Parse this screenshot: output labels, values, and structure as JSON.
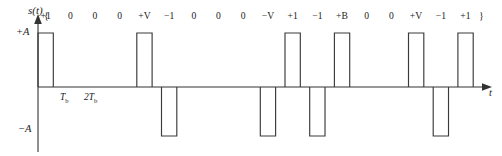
{
  "figure": {
    "signal_label": "s(t)",
    "amplitude_positive_label": "+A",
    "amplitude_negative_label": "−A",
    "time_axis_label": "t",
    "brace_open": "{",
    "brace_close": "}",
    "tick_labels": [
      {
        "text": "T",
        "sub": "b",
        "x": 60
      },
      {
        "text": "2T",
        "sub": "b",
        "x": 84
      }
    ]
  },
  "chart_data": {
    "type": "line",
    "title": "",
    "subtitle": "",
    "xlabel": "t",
    "ylabel": "s(t)",
    "grid": false,
    "legend": "none",
    "ylim": [
      -1,
      1
    ],
    "ytick_labels": [
      "+A",
      "−A"
    ],
    "ytick_values": [
      1,
      -1
    ],
    "xtick_labels": [
      "T_b",
      "2T_b"
    ],
    "xtick_values": [
      1,
      2
    ],
    "bit_period_px": 24.7,
    "origin_px": {
      "x": 38,
      "y": 87
    },
    "level_px": {
      "positive": 33,
      "negative": 136
    },
    "pulse_duty": 0.62,
    "categories": [
      "+1",
      "0",
      "0",
      "0",
      "+V",
      "−1",
      "0",
      "0",
      "0",
      "−V",
      "+1",
      "−1",
      "+B",
      "0",
      "0",
      "+V",
      "−1",
      "+1"
    ],
    "values": [
      1,
      0,
      0,
      0,
      1,
      -1,
      0,
      0,
      0,
      -1,
      1,
      -1,
      1,
      0,
      0,
      1,
      -1,
      1
    ],
    "symbols": [
      {
        "label": "+1",
        "level": 1
      },
      {
        "label": "0",
        "level": 0
      },
      {
        "label": "0",
        "level": 0
      },
      {
        "label": "0",
        "level": 0
      },
      {
        "label": "+V",
        "level": 1
      },
      {
        "label": "−1",
        "level": -1
      },
      {
        "label": "0",
        "level": 0
      },
      {
        "label": "0",
        "level": 0
      },
      {
        "label": "0",
        "level": 0
      },
      {
        "label": "−V",
        "level": -1
      },
      {
        "label": "+1",
        "level": 1
      },
      {
        "label": "−1",
        "level": -1
      },
      {
        "label": "+B",
        "level": 1
      },
      {
        "label": "0",
        "level": 0
      },
      {
        "label": "0",
        "level": 0
      },
      {
        "label": "+V",
        "level": 1
      },
      {
        "label": "−1",
        "level": -1
      },
      {
        "label": "+1",
        "level": 1
      }
    ]
  }
}
